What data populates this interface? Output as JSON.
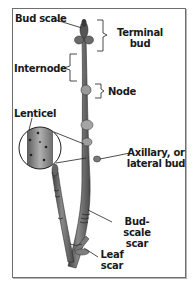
{
  "diagram": {
    "labels": {
      "bud_scale": "Bud scale",
      "terminal_bud_line1": "Terminal",
      "terminal_bud_line2": "bud",
      "internode": "Internode",
      "node": "Node",
      "lenticel": "Lenticel",
      "axillary_line1": "Axillary, or",
      "axillary_line2": "lateral bud",
      "bud_scale_scar_line1": "Bud-scale",
      "bud_scale_scar_line2": "scar",
      "leaf_scar_line1": "Leaf",
      "leaf_scar_line2": "scar"
    },
    "colors": {
      "border": "#6f6f6f",
      "stem_dark": "#4a4a4a",
      "stem_mid": "#7d7d7d",
      "stem_light": "#a8a8a8",
      "text": "#1a1a1a"
    }
  }
}
